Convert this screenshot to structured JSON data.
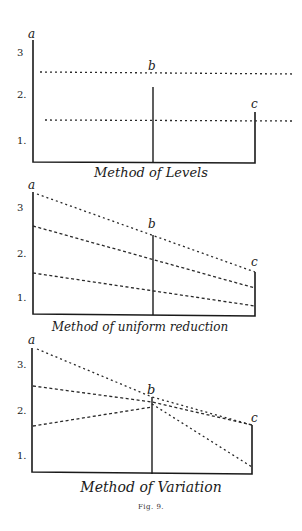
{
  "figure": {
    "caption": "Fig. 9.",
    "panels": [
      {
        "title": "Method of Levels",
        "labels": {
          "a": "a",
          "b": "b",
          "c": "c"
        },
        "y_ticks": [
          "3",
          "2.",
          "1."
        ],
        "lines": [
          {
            "name": "upper-level",
            "from": [
              40,
              72
            ],
            "to": [
              295,
              74
            ]
          },
          {
            "name": "lower-level",
            "from": [
              45,
              120
            ],
            "to": [
              292,
              121
            ]
          }
        ]
      },
      {
        "title": "Method of uniform reduction",
        "labels": {
          "a": "a",
          "b": "b",
          "c": "c"
        },
        "y_ticks": [
          "3",
          "2.",
          "1."
        ],
        "lines": [
          {
            "name": "upper",
            "from": [
              37,
              194
            ],
            "to": [
              255,
              272
            ]
          },
          {
            "name": "middle",
            "from": [
              33,
              226
            ],
            "to": [
              255,
              288
            ]
          },
          {
            "name": "lower",
            "from": [
              33,
              273
            ],
            "to": [
              255,
              306
            ]
          }
        ]
      },
      {
        "title": "Method of Variation",
        "labels": {
          "a": "a",
          "b": "b",
          "c": "c"
        },
        "y_ticks": [
          "3.",
          "2.",
          "1."
        ],
        "lines": [
          {
            "name": "top-to-c",
            "points": [
              [
                37,
                349
              ],
              [
                152,
                397
              ],
              [
                252,
                425
              ]
            ]
          },
          {
            "name": "mid-to-b",
            "points": [
              [
                33,
                386
              ],
              [
                152,
                402
              ],
              [
                252,
                425
              ]
            ]
          },
          {
            "name": "low-to-b",
            "points": [
              [
                33,
                426
              ],
              [
                152,
                407
              ]
            ]
          },
          {
            "name": "b-to-bottom",
            "points": [
              [
                152,
                404
              ],
              [
                252,
                467
              ]
            ]
          }
        ]
      }
    ]
  }
}
